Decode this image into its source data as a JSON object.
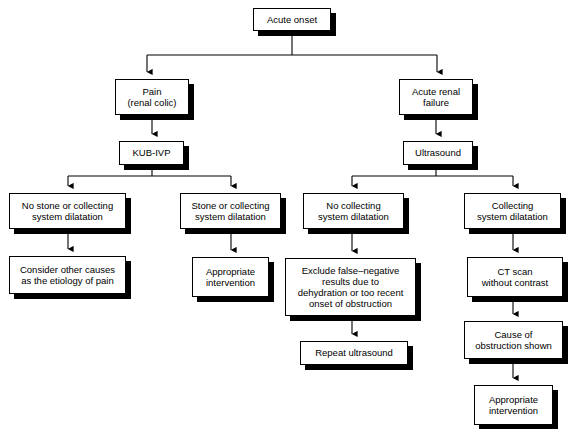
{
  "diagram": {
    "type": "flowchart",
    "orientation": "top-down",
    "background_color": "#ffffff",
    "node_fill_color": "#ffffff",
    "node_border_color": "#000000",
    "shadow_color": "#000000",
    "connector_color": "#000000",
    "nodes": [
      {
        "id": "acute-onset",
        "label": "Acute onset",
        "x": 253,
        "y": 8,
        "w": 78,
        "h": 23,
        "font_size": 9.5
      },
      {
        "id": "pain-renal-colic",
        "label": "Pain\n(renal colic)",
        "x": 115,
        "y": 79,
        "w": 74,
        "h": 36,
        "font_size": 9.5
      },
      {
        "id": "acute-renal-failure",
        "label": "Acute renal\nfailure",
        "x": 399,
        "y": 79,
        "w": 74,
        "h": 36,
        "font_size": 9.5
      },
      {
        "id": "kub-ivp",
        "label": "KUB-IVP",
        "x": 119,
        "y": 141,
        "w": 65,
        "h": 24,
        "font_size": 9.5
      },
      {
        "id": "ultrasound",
        "label": "Ultrasound",
        "x": 403,
        "y": 141,
        "w": 70,
        "h": 24,
        "font_size": 9.5
      },
      {
        "id": "no-stone-or-collecting",
        "label": "No stone or collecting\nsystem dilatation",
        "x": 9,
        "y": 193,
        "w": 117,
        "h": 36,
        "font_size": 9.5
      },
      {
        "id": "stone-or-collecting",
        "label": "Stone or collecting\nsystem dilatation",
        "x": 180,
        "y": 193,
        "w": 101,
        "h": 36,
        "font_size": 9.5
      },
      {
        "id": "no-collecting-dilatation",
        "label": "No collecting\nsystem dilatation",
        "x": 303,
        "y": 193,
        "w": 101,
        "h": 36,
        "font_size": 9.5
      },
      {
        "id": "collecting-dilatation",
        "label": "Collecting\nsystem dilatation",
        "x": 464,
        "y": 193,
        "w": 97,
        "h": 36,
        "font_size": 9.5
      },
      {
        "id": "consider-other-causes",
        "label": "Consider other causes\nas the etiology of pain",
        "x": 9,
        "y": 256,
        "w": 117,
        "h": 38,
        "font_size": 9.5
      },
      {
        "id": "appropriate-intervention-left",
        "label": "Appropriate\nintervention",
        "x": 192,
        "y": 257,
        "w": 77,
        "h": 40,
        "font_size": 9.5
      },
      {
        "id": "exclude-false-negative",
        "label": "Exclude false–negative\nresults due to\ndehydration or too recent\nonset of obstruction",
        "x": 285,
        "y": 258,
        "w": 131,
        "h": 58,
        "font_size": 9.5
      },
      {
        "id": "ct-scan",
        "label": "CT scan\nwithout contrast",
        "x": 467,
        "y": 257,
        "w": 96,
        "h": 40,
        "font_size": 9.5
      },
      {
        "id": "repeat-ultrasound",
        "label": "Repeat ultrasound",
        "x": 300,
        "y": 341,
        "w": 108,
        "h": 24,
        "font_size": 9.5
      },
      {
        "id": "cause-of-obstruction",
        "label": "Cause of\nobstruction shown",
        "x": 464,
        "y": 321,
        "w": 99,
        "h": 38,
        "font_size": 9.5
      },
      {
        "id": "appropriate-intervention-right",
        "label": "Appropriate\nintervention",
        "x": 474,
        "y": 385,
        "w": 79,
        "h": 40,
        "font_size": 9.5
      }
    ],
    "edges": [
      {
        "id": "acute-onset-to-split",
        "from": "acute-onset",
        "to": "split-1",
        "kind": "fork"
      },
      {
        "id": "split-to-pain",
        "from": "split-1",
        "to": "pain-renal-colic",
        "kind": "arrow"
      },
      {
        "id": "split-to-arf",
        "from": "split-1",
        "to": "acute-renal-failure",
        "kind": "arrow"
      },
      {
        "id": "pain-to-kub",
        "from": "pain-renal-colic",
        "to": "kub-ivp",
        "kind": "arrow"
      },
      {
        "id": "arf-to-ultrasound",
        "from": "acute-renal-failure",
        "to": "ultrasound",
        "kind": "arrow"
      },
      {
        "id": "kub-to-no-stone",
        "from": "kub-ivp",
        "to": "no-stone-or-collecting",
        "kind": "fork-arrow"
      },
      {
        "id": "kub-to-stone",
        "from": "kub-ivp",
        "to": "stone-or-collecting",
        "kind": "fork-arrow"
      },
      {
        "id": "us-to-no-collecting",
        "from": "ultrasound",
        "to": "no-collecting-dilatation",
        "kind": "fork-arrow"
      },
      {
        "id": "us-to-collecting",
        "from": "ultrasound",
        "to": "collecting-dilatation",
        "kind": "fork-arrow"
      },
      {
        "id": "no-stone-to-consider",
        "from": "no-stone-or-collecting",
        "to": "consider-other-causes",
        "kind": "arrow"
      },
      {
        "id": "stone-to-appropriate",
        "from": "stone-or-collecting",
        "to": "appropriate-intervention-left",
        "kind": "arrow"
      },
      {
        "id": "no-collecting-to-exclude",
        "from": "no-collecting-dilatation",
        "to": "exclude-false-negative",
        "kind": "arrow"
      },
      {
        "id": "exclude-to-repeat",
        "from": "exclude-false-negative",
        "to": "repeat-ultrasound",
        "kind": "arrow"
      },
      {
        "id": "collecting-to-ct",
        "from": "collecting-dilatation",
        "to": "ct-scan",
        "kind": "arrow"
      },
      {
        "id": "ct-to-cause",
        "from": "ct-scan",
        "to": "cause-of-obstruction",
        "kind": "arrow"
      },
      {
        "id": "cause-to-appropriate",
        "from": "cause-of-obstruction",
        "to": "appropriate-intervention-right",
        "kind": "arrow"
      }
    ]
  }
}
